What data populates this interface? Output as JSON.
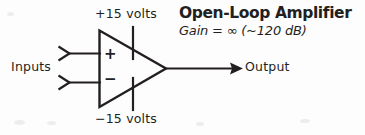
{
  "figure": {
    "type": "schematic-diagram",
    "background_color": "#fdfdfd",
    "ink_color": "#231f20"
  },
  "title": {
    "heading": "Open-Loop Amplifier",
    "subheading": "Gain = ∞ (~120 dB)"
  },
  "labels": {
    "supply_positive": "+15 volts",
    "supply_negative": "−15 volts",
    "inputs": "Inputs",
    "output": "Output",
    "terminal_noninverting": "+",
    "terminal_inverting": "−"
  },
  "symbols": {
    "amplifier_triangle": "op-amp-triangle",
    "input_chevron_top": "input-arrow-marker",
    "input_chevron_bottom": "input-arrow-marker",
    "output_arrowhead": "output-arrow-marker",
    "supply_rail_top": "power-rail-line",
    "supply_rail_bottom": "power-rail-line"
  }
}
